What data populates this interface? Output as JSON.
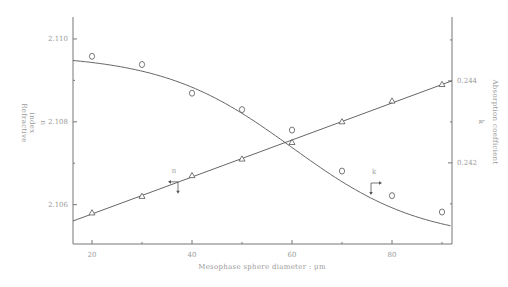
{
  "chart_data": {
    "type": "line",
    "title": "",
    "xlabel": "Mesophase sphere diameter : μm",
    "x_ticks": [
      20,
      40,
      60,
      80
    ],
    "x_minor_ticks": [
      30,
      50,
      70,
      90
    ],
    "xlim": [
      16.2,
      92
    ],
    "left_axis": {
      "label_line1": "Refractive",
      "label_line2": "index",
      "symbol": "n",
      "ticks": [
        2.106,
        2.108,
        2.11
      ],
      "tick_labels": [
        "2.106",
        "2.108",
        "2.110"
      ],
      "minor_ticks": [
        2.107,
        2.109
      ],
      "ylim": [
        2.10505,
        2.11053
      ]
    },
    "right_axis": {
      "label": "Absorption coefficient",
      "symbol": "k",
      "ticks": [
        0.242,
        0.244
      ],
      "tick_labels": [
        "0.242",
        "0.244"
      ],
      "minor_ticks": [
        0.241,
        0.243,
        0.245
      ],
      "ylim": [
        0.24002,
        0.24556
      ]
    },
    "x": [
      20,
      30,
      40,
      50,
      60,
      70,
      80,
      90
    ],
    "series": [
      {
        "name": "n",
        "axis": "left",
        "marker": "triangle",
        "values": [
          2.1058,
          2.1062,
          2.1067,
          2.1071,
          2.1075,
          2.108,
          2.1085,
          2.1089
        ],
        "fit": "linear",
        "annotation": {
          "text": "n",
          "x": 37,
          "arrow": "left"
        }
      },
      {
        "name": "k",
        "axis": "right",
        "marker": "circle",
        "values": [
          0.2446,
          0.2444,
          0.2437,
          0.2433,
          0.2428,
          0.2418,
          0.2412,
          0.2408
        ],
        "fit": "sigmoid",
        "annotation": {
          "text": "k",
          "x": 76,
          "arrow": "right"
        }
      }
    ],
    "legend": "inline arrows pointing to respective axes",
    "grid": false,
    "colors": {
      "line": "#555555",
      "axis": "#777777",
      "text": "#9a9a9a"
    }
  }
}
